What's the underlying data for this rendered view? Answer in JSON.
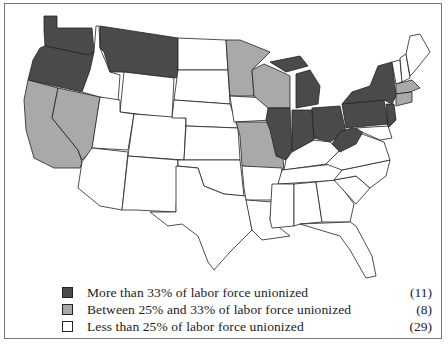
{
  "colors": {
    "high": "#4a4a4a",
    "mid": "#a9a9a9",
    "low": "#ffffff",
    "border": "#222222"
  },
  "legend": [
    {
      "category": "high",
      "label": "More than 33% of labor force unionized",
      "count": "(11)"
    },
    {
      "category": "mid",
      "label": "Between 25% and 33% of labor force unionized",
      "count": "(8)"
    },
    {
      "category": "low",
      "label": "Less than 25% of labor force unionized",
      "count": "(29)"
    }
  ],
  "states": {
    "high": [
      "Washington",
      "Oregon",
      "Montana",
      "Michigan",
      "Illinois",
      "Indiana",
      "Ohio",
      "West Virginia",
      "Pennsylvania",
      "New York",
      "New Jersey"
    ],
    "mid": [
      "California",
      "Nevada",
      "Minnesota",
      "Wisconsin",
      "Missouri",
      "Massachusetts",
      "Connecticut",
      "Rhode Island"
    ],
    "low_count": 29
  }
}
